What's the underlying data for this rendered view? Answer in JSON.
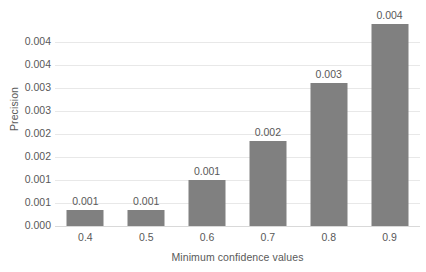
{
  "chart_data": {
    "type": "bar",
    "title": "",
    "xlabel": "Minimum confidence values",
    "ylabel": "Precision",
    "categories": [
      "0.4",
      "0.5",
      "0.6",
      "0.7",
      "0.8",
      "0.9"
    ],
    "values": [
      0.00035,
      0.00035,
      0.001,
      0.00185,
      0.0031,
      0.0044
    ],
    "data_labels": [
      "0.001",
      "0.001",
      "0.001",
      "0.002",
      "0.003",
      "0.004"
    ],
    "ylim": [
      0,
      0.0045
    ],
    "y_ticks": [
      0,
      0.0005,
      0.001,
      0.0015,
      0.002,
      0.0025,
      0.003,
      0.0035,
      0.004
    ],
    "y_tick_labels": [
      "0.000",
      "0.001",
      "0.001",
      "0.002",
      "0.002",
      "0.003",
      "0.003",
      "0.004",
      "0.004"
    ],
    "grid": true,
    "legend": false,
    "bar_color": "#808080",
    "gridline_color": "#e8e8e8",
    "axis_color": "#d9d9d9",
    "text_color": "#595959"
  }
}
